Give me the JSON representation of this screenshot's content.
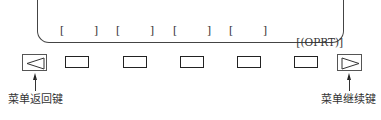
{
  "diagram": {
    "soft_key_labels": [
      {
        "open": "[",
        "text": "",
        "close": "]"
      },
      {
        "open": "[",
        "text": "",
        "close": "]"
      },
      {
        "open": "[",
        "text": "",
        "close": "]"
      },
      {
        "open": "[",
        "text": "",
        "close": "]"
      },
      {
        "open": "[",
        "text": "(OPRT)",
        "close": "]"
      }
    ],
    "soft_keys_count": 5,
    "left_key": {
      "icon": "triangle-left-icon",
      "caption": "菜单返回键"
    },
    "right_key": {
      "icon": "triangle-right-icon",
      "caption": "菜单继续键"
    }
  }
}
